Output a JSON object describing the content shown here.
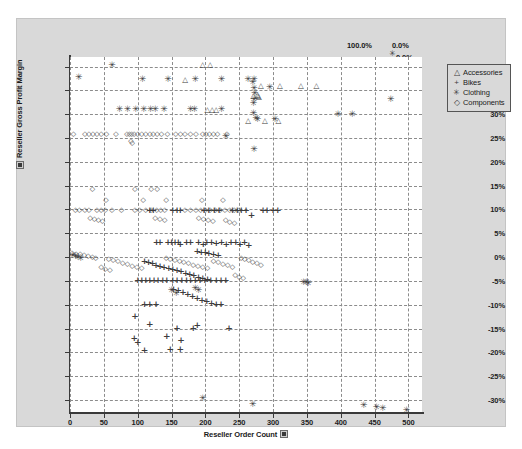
{
  "chart_data": {
    "type": "scatter",
    "title": "",
    "xlabel": "Reseller Order Count",
    "ylabel": "Reseller Gross Profit Margin",
    "xlim": [
      0,
      520
    ],
    "ylim": [
      -32.5,
      42
    ],
    "grid": true,
    "legend_position": "right",
    "x_ticks": [
      "0",
      "50",
      "100",
      "150",
      "200",
      "250",
      "300",
      "350",
      "400",
      "450",
      "500"
    ],
    "x_tick_values": [
      0,
      50,
      100,
      150,
      200,
      250,
      300,
      350,
      400,
      450,
      500
    ],
    "y_ticks": [
      "40%",
      "35%",
      "30%",
      "25%",
      "20%",
      "15%",
      "10%",
      "5%",
      "0%",
      "-5%",
      "-10%",
      "-15%",
      "-20%",
      "-25%",
      "-30%"
    ],
    "y_tick_values": [
      40,
      35,
      30,
      25,
      20,
      15,
      10,
      5,
      0,
      -5,
      -10,
      -15,
      -20,
      -25,
      -30
    ],
    "corner_labels": {
      "top_left": "100.0%",
      "top_right": "0.0%",
      "middle_right": "0.0%",
      "bottom_right": "100.0%"
    },
    "series": [
      {
        "name": "Accessories",
        "marker": "triangle",
        "marker_glyph": "△",
        "color": "#3d3d3d",
        "points": [
          [
            196,
            40.3
          ],
          [
            207,
            40.3
          ],
          [
            170,
            37.2
          ],
          [
            310,
            36.0
          ],
          [
            341,
            36.0
          ],
          [
            364,
            36.0
          ],
          [
            282,
            35.9
          ],
          [
            278,
            33.8
          ],
          [
            203,
            30.8
          ],
          [
            210,
            30.8
          ],
          [
            216,
            30.8
          ],
          [
            263,
            28.5
          ],
          [
            288,
            28.5
          ],
          [
            308,
            28.5
          ],
          [
            271,
            33.8
          ],
          [
            277,
            34.0
          ],
          [
            279,
            33.6
          ]
        ]
      },
      {
        "name": "Bikes",
        "marker": "plus",
        "marker_glyph": "+",
        "color": "#3d3d3d",
        "points": [
          [
            118,
            9.6
          ],
          [
            123,
            9.6
          ],
          [
            152,
            9.6
          ],
          [
            158,
            9.6
          ],
          [
            163,
            9.6
          ],
          [
            198,
            9.6
          ],
          [
            205,
            9.6
          ],
          [
            213,
            9.6
          ],
          [
            220,
            9.6
          ],
          [
            240,
            9.6
          ],
          [
            247,
            9.6
          ],
          [
            253,
            9.6
          ],
          [
            260,
            9.6
          ],
          [
            285,
            9.6
          ],
          [
            291,
            9.6
          ],
          [
            268,
            8.6
          ],
          [
            300,
            9.6
          ],
          [
            307,
            9.6
          ],
          [
            128,
            3.0
          ],
          [
            133,
            3.0
          ],
          [
            145,
            3.0
          ],
          [
            150,
            3.0
          ],
          [
            155,
            3.0
          ],
          [
            160,
            3.0
          ],
          [
            163,
            2.5
          ],
          [
            172,
            3.0
          ],
          [
            178,
            3.0
          ],
          [
            190,
            3.0
          ],
          [
            197,
            2.6
          ],
          [
            202,
            3.0
          ],
          [
            209,
            3.0
          ],
          [
            216,
            2.8
          ],
          [
            224,
            3.0
          ],
          [
            231,
            2.5
          ],
          [
            238,
            3.0
          ],
          [
            245,
            3.0
          ],
          [
            251,
            2.6
          ],
          [
            258,
            3.0
          ],
          [
            264,
            2.4
          ],
          [
            188,
            1.0
          ],
          [
            194,
            0.9
          ],
          [
            200,
            0.8
          ],
          [
            205,
            0.6
          ],
          [
            212,
            0.5
          ],
          [
            219,
            0.3
          ],
          [
            110,
            -1.0
          ],
          [
            116,
            -1.2
          ],
          [
            122,
            -1.5
          ],
          [
            127,
            -1.8
          ],
          [
            133,
            -2.0
          ],
          [
            139,
            -2.2
          ],
          [
            146,
            -2.5
          ],
          [
            152,
            -2.8
          ],
          [
            158,
            -3.0
          ],
          [
            164,
            -3.2
          ],
          [
            171,
            -3.5
          ],
          [
            177,
            -3.8
          ],
          [
            183,
            -4.0
          ],
          [
            190,
            -4.3
          ],
          [
            196,
            -4.6
          ],
          [
            203,
            -4.9
          ],
          [
            100,
            -5.1
          ],
          [
            106,
            -5.1
          ],
          [
            112,
            -5.1
          ],
          [
            118,
            -5.1
          ],
          [
            124,
            -5.1
          ],
          [
            130,
            -5.1
          ],
          [
            137,
            -5.1
          ],
          [
            143,
            -5.1
          ],
          [
            152,
            -5.1
          ],
          [
            158,
            -5.1
          ],
          [
            165,
            -5.1
          ],
          [
            172,
            -5.1
          ],
          [
            178,
            -5.1
          ],
          [
            185,
            -5.1
          ],
          [
            192,
            -5.1
          ],
          [
            199,
            -5.1
          ],
          [
            208,
            -5.1
          ],
          [
            216,
            -5.1
          ],
          [
            223,
            -5.1
          ],
          [
            230,
            -5.1
          ],
          [
            153,
            -6.8
          ],
          [
            160,
            -7.2
          ],
          [
            167,
            -7.6
          ],
          [
            174,
            -8.0
          ],
          [
            181,
            -8.4
          ],
          [
            188,
            -8.8
          ],
          [
            195,
            -9.2
          ],
          [
            202,
            -9.5
          ],
          [
            209,
            -9.9
          ],
          [
            216,
            -10.1
          ],
          [
            223,
            -10.1
          ],
          [
            110,
            -10.1
          ],
          [
            118,
            -10.1
          ],
          [
            127,
            -10.1
          ],
          [
            96,
            -12.5
          ],
          [
            118,
            -14.2
          ],
          [
            143,
            -16.8
          ],
          [
            164,
            -17.5
          ],
          [
            110,
            -19.8
          ],
          [
            148,
            -19.5
          ],
          [
            163,
            -19.5
          ],
          [
            95,
            -17.2
          ],
          [
            100,
            -18.0
          ],
          [
            158,
            -15.0
          ],
          [
            182,
            -15.0
          ],
          [
            188,
            -14.5
          ],
          [
            235,
            -15.0
          ]
        ]
      },
      {
        "name": "Clothing",
        "marker": "asterisk",
        "marker_glyph": "✳",
        "color": "#3d3d3d",
        "points": [
          [
            62,
            40.3
          ],
          [
            13,
            37.8
          ],
          [
            107,
            37.3
          ],
          [
            145,
            37.3
          ],
          [
            185,
            37.3
          ],
          [
            224,
            37.3
          ],
          [
            263,
            37.3
          ],
          [
            270,
            36.7
          ],
          [
            272,
            37.3
          ],
          [
            272,
            35.5
          ],
          [
            295,
            35.7
          ],
          [
            474,
            33.2
          ],
          [
            73,
            31.1
          ],
          [
            85,
            31.1
          ],
          [
            97,
            31.1
          ],
          [
            109,
            31.1
          ],
          [
            119,
            31.1
          ],
          [
            126,
            31.1
          ],
          [
            139,
            31.1
          ],
          [
            178,
            31.1
          ],
          [
            184,
            31.1
          ],
          [
            224,
            31.1
          ],
          [
            271,
            32.3
          ],
          [
            271,
            30.3
          ],
          [
            275,
            29.3
          ],
          [
            272,
            33.2
          ],
          [
            273,
            34.5
          ],
          [
            396,
            30.0
          ],
          [
            417,
            30.0
          ],
          [
            277,
            28.9
          ],
          [
            303,
            28.9
          ],
          [
            230,
            25.5
          ],
          [
            272,
            22.6
          ],
          [
            4,
            0.5
          ],
          [
            8,
            0.3
          ],
          [
            12,
            0.1
          ],
          [
            16,
            -0.1
          ],
          [
            150,
            -7.0
          ],
          [
            157,
            -7.5
          ],
          [
            345,
            -5.3
          ],
          [
            349,
            -5.2
          ],
          [
            352,
            -5.4
          ],
          [
            196,
            -29.5
          ],
          [
            270,
            -30.8
          ],
          [
            434,
            -31.0
          ],
          [
            453,
            -31.5
          ],
          [
            462,
            -31.6
          ],
          [
            497,
            -32.0
          ],
          [
            185,
            -6.5
          ],
          [
            190,
            -6.8
          ]
        ]
      },
      {
        "name": "Components",
        "marker": "diamond",
        "marker_glyph": "◇",
        "color": "#3d3d3d",
        "points": [
          [
            5,
            25.6
          ],
          [
            22,
            25.6
          ],
          [
            28,
            25.6
          ],
          [
            34,
            25.6
          ],
          [
            40,
            25.6
          ],
          [
            46,
            25.6
          ],
          [
            54,
            25.6
          ],
          [
            68,
            25.6
          ],
          [
            84,
            25.6
          ],
          [
            88,
            25.6
          ],
          [
            91,
            25.6
          ],
          [
            95,
            25.6
          ],
          [
            100,
            25.6
          ],
          [
            106,
            25.6
          ],
          [
            112,
            25.6
          ],
          [
            118,
            25.6
          ],
          [
            123,
            25.6
          ],
          [
            129,
            25.6
          ],
          [
            135,
            25.6
          ],
          [
            144,
            25.6
          ],
          [
            156,
            25.6
          ],
          [
            163,
            25.6
          ],
          [
            170,
            25.6
          ],
          [
            178,
            25.6
          ],
          [
            186,
            25.6
          ],
          [
            196,
            25.6
          ],
          [
            201,
            25.6
          ],
          [
            206,
            25.6
          ],
          [
            212,
            25.6
          ],
          [
            218,
            25.6
          ],
          [
            232,
            25.6
          ],
          [
            90,
            24.2
          ],
          [
            92,
            23.7
          ],
          [
            33,
            14.0
          ],
          [
            96,
            14.0
          ],
          [
            120,
            14.0
          ],
          [
            129,
            14.0
          ],
          [
            53,
            11.8
          ],
          [
            108,
            11.8
          ],
          [
            142,
            11.8
          ],
          [
            195,
            11.8
          ],
          [
            226,
            11.8
          ],
          [
            8,
            9.6
          ],
          [
            14,
            9.6
          ],
          [
            22,
            9.6
          ],
          [
            28,
            9.6
          ],
          [
            40,
            9.6
          ],
          [
            46,
            9.6
          ],
          [
            52,
            9.6
          ],
          [
            62,
            9.6
          ],
          [
            76,
            9.6
          ],
          [
            96,
            9.6
          ],
          [
            103,
            9.6
          ],
          [
            112,
            9.6
          ],
          [
            120,
            9.6
          ],
          [
            128,
            9.6
          ],
          [
            134,
            9.6
          ],
          [
            140,
            9.6
          ],
          [
            170,
            9.6
          ],
          [
            178,
            9.6
          ],
          [
            186,
            9.6
          ],
          [
            193,
            9.6
          ],
          [
            200,
            9.6
          ],
          [
            207,
            9.6
          ],
          [
            215,
            9.6
          ],
          [
            222,
            9.6
          ],
          [
            229,
            9.6
          ],
          [
            236,
            9.6
          ],
          [
            243,
            9.6
          ],
          [
            250,
            9.6
          ],
          [
            30,
            8.0
          ],
          [
            36,
            7.8
          ],
          [
            42,
            7.6
          ],
          [
            48,
            7.4
          ],
          [
            126,
            8.0
          ],
          [
            133,
            7.8
          ],
          [
            140,
            7.6
          ],
          [
            190,
            8.0
          ],
          [
            197,
            7.8
          ],
          [
            204,
            7.6
          ],
          [
            211,
            7.4
          ],
          [
            230,
            7.5
          ],
          [
            236,
            7.2
          ],
          [
            243,
            7.0
          ],
          [
            3,
            0.7
          ],
          [
            9,
            0.5
          ],
          [
            15,
            0.4
          ],
          [
            21,
            0.2
          ],
          [
            27,
            0.0
          ],
          [
            33,
            -0.2
          ],
          [
            38,
            -0.4
          ],
          [
            57,
            -0.5
          ],
          [
            64,
            -0.8
          ],
          [
            71,
            -1.1
          ],
          [
            78,
            -1.4
          ],
          [
            85,
            -1.7
          ],
          [
            92,
            -2.0
          ],
          [
            99,
            -2.3
          ],
          [
            106,
            -2.5
          ],
          [
            142,
            -0.4
          ],
          [
            148,
            -0.6
          ],
          [
            155,
            -0.8
          ],
          [
            162,
            -1.0
          ],
          [
            168,
            -1.3
          ],
          [
            175,
            -1.5
          ],
          [
            182,
            -1.8
          ],
          [
            189,
            -2.0
          ],
          [
            196,
            -2.3
          ],
          [
            203,
            -2.5
          ],
          [
            212,
            -1.0
          ],
          [
            219,
            -1.3
          ],
          [
            226,
            -1.6
          ],
          [
            233,
            -1.9
          ],
          [
            240,
            -2.2
          ],
          [
            253,
            -0.3
          ],
          [
            258,
            -0.6
          ],
          [
            264,
            -0.9
          ],
          [
            270,
            -1.2
          ],
          [
            276,
            -1.5
          ],
          [
            282,
            -1.8
          ],
          [
            244,
            -4.0
          ],
          [
            250,
            -4.3
          ],
          [
            256,
            -4.6
          ],
          [
            46,
            -2.3
          ],
          [
            52,
            -2.6
          ],
          [
            59,
            -2.9
          ]
        ]
      }
    ]
  },
  "legend": {
    "items": [
      {
        "label": "Accessories",
        "marker": "△"
      },
      {
        "label": "Bikes",
        "marker": "+"
      },
      {
        "label": "Clothing",
        "marker": "✳"
      },
      {
        "label": "Components",
        "marker": "◇"
      }
    ]
  }
}
